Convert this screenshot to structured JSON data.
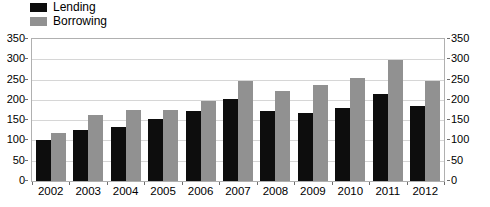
{
  "chart_data": {
    "type": "bar",
    "title": "",
    "subtitle": "",
    "xlabel": "",
    "ylabel": "",
    "categories": [
      "2002",
      "2003",
      "2004",
      "2005",
      "2006",
      "2007",
      "2008",
      "2009",
      "2010",
      "2011",
      "2012"
    ],
    "series": [
      {
        "name": "Lending",
        "color": "#0d0d0d",
        "values": [
          100,
          125,
          134,
          153,
          172,
          203,
          172,
          168,
          180,
          214,
          184
        ]
      },
      {
        "name": "Borrowing",
        "color": "#919191",
        "values": [
          118,
          163,
          175,
          176,
          198,
          247,
          222,
          237,
          254,
          298,
          246
        ]
      }
    ],
    "ylim": [
      0,
      350
    ],
    "ytick_step": 50,
    "yticks": [
      0,
      50,
      100,
      150,
      200,
      250,
      300,
      350
    ],
    "ytick_labels": [
      "0",
      "50",
      "100",
      "150",
      "200",
      "250",
      "300",
      "350"
    ],
    "right_axis": {
      "ylim": [
        0,
        350
      ],
      "yticks": [
        0,
        50,
        100,
        150,
        200,
        250,
        300,
        350
      ],
      "ytick_labels": [
        "0",
        "50",
        "100",
        "150",
        "200",
        "250",
        "300",
        "350"
      ]
    },
    "grid": true,
    "grid_axis": "y",
    "legend": {
      "position": "top-left",
      "entries": [
        {
          "label": "Lending",
          "color": "#0d0d0d",
          "swatch": "black-square-swatch"
        },
        {
          "label": "Borrowing",
          "color": "#919191",
          "swatch": "gray-square-swatch"
        }
      ]
    },
    "colors": {
      "lending": "#0d0d0d",
      "borrowing": "#919191",
      "gridline": "#d6d6d6",
      "frame": "#b0b0b0",
      "background": "#ffffff",
      "text": "#000000"
    }
  }
}
